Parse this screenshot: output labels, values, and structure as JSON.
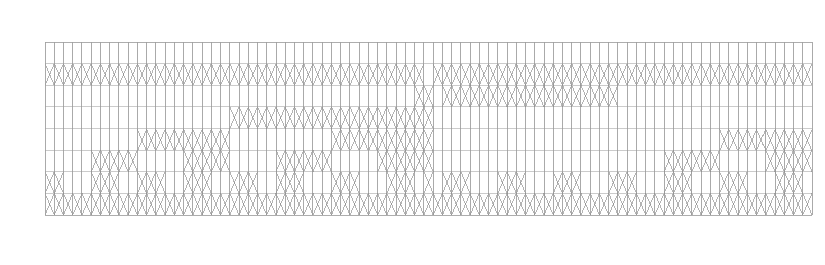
{
  "figure": {
    "kind": "trellis-network",
    "background_color": "#ffffff",
    "line_color": "#9a9a9a",
    "grid_color": "#a8a8a8",
    "cross_color": "#808080"
  },
  "chart_data": {
    "type": "diagram",
    "title": "",
    "xlabel": "",
    "ylabel": "",
    "geometry": {
      "plot_left": 45,
      "plot_top": 42,
      "plot_right": 812,
      "plot_bottom": 215,
      "rows": 8,
      "columns": 83,
      "cell_width": 9.24,
      "row_height": 21.6,
      "block_split_column": 42,
      "blocks": 2,
      "grid": true,
      "legend": "none",
      "axis_ticks": false
    },
    "legend_entries": [],
    "annotations": [],
    "series": [
      {
        "name": "row-0",
        "crossings": [
          0,
          0,
          0,
          0,
          0,
          0,
          0,
          0,
          0,
          0,
          0,
          0,
          0,
          0,
          0,
          0,
          0,
          0,
          0,
          0,
          0,
          0,
          0,
          0,
          0,
          0,
          0,
          0,
          0,
          0,
          0,
          0,
          0,
          0,
          0,
          0,
          0,
          0,
          0,
          0,
          0,
          0,
          0,
          0,
          0,
          0,
          0,
          0,
          0,
          0,
          0,
          0,
          0,
          0,
          0,
          0,
          0,
          0,
          0,
          0,
          0,
          0,
          0,
          0,
          0,
          0,
          0,
          0,
          0,
          0,
          0,
          0,
          0,
          0,
          0,
          0,
          0,
          0,
          0,
          0,
          0,
          0,
          0
        ]
      },
      {
        "name": "row-1",
        "crossings": [
          1,
          1,
          1,
          1,
          1,
          1,
          1,
          1,
          1,
          1,
          1,
          1,
          1,
          1,
          1,
          1,
          1,
          1,
          1,
          1,
          1,
          1,
          1,
          1,
          1,
          1,
          1,
          1,
          1,
          1,
          1,
          1,
          1,
          1,
          1,
          1,
          1,
          1,
          1,
          1,
          1,
          0,
          1,
          1,
          1,
          1,
          1,
          1,
          1,
          1,
          1,
          1,
          1,
          1,
          1,
          1,
          1,
          1,
          1,
          1,
          1,
          1,
          1,
          1,
          1,
          1,
          1,
          1,
          1,
          1,
          1,
          1,
          1,
          1,
          1,
          1,
          1,
          1,
          1,
          1,
          1,
          1,
          1
        ]
      },
      {
        "name": "row-2",
        "crossings": [
          0,
          0,
          0,
          0,
          0,
          0,
          0,
          0,
          0,
          0,
          0,
          0,
          0,
          0,
          0,
          0,
          0,
          0,
          0,
          0,
          0,
          0,
          0,
          0,
          0,
          0,
          0,
          0,
          0,
          0,
          0,
          0,
          0,
          0,
          0,
          0,
          0,
          0,
          0,
          0,
          1,
          1,
          1,
          1,
          1,
          1,
          1,
          1,
          1,
          1,
          1,
          1,
          1,
          1,
          1,
          1,
          1,
          1,
          1,
          1,
          1,
          1,
          0,
          0,
          0,
          0,
          0,
          0,
          0,
          0,
          0,
          0,
          0,
          0,
          0,
          0,
          0,
          0,
          0,
          0,
          0,
          0,
          0
        ]
      },
      {
        "name": "row-3",
        "crossings": [
          0,
          0,
          0,
          0,
          0,
          0,
          0,
          0,
          0,
          0,
          0,
          0,
          0,
          0,
          0,
          0,
          0,
          0,
          0,
          0,
          1,
          1,
          1,
          1,
          1,
          1,
          1,
          1,
          1,
          1,
          1,
          1,
          1,
          1,
          1,
          1,
          1,
          1,
          1,
          1,
          1,
          1,
          0,
          0,
          0,
          0,
          0,
          0,
          0,
          0,
          0,
          0,
          0,
          0,
          0,
          0,
          0,
          0,
          0,
          0,
          0,
          0,
          0,
          0,
          0,
          0,
          0,
          0,
          0,
          0,
          0,
          0,
          0,
          0,
          0,
          0,
          0,
          0,
          0,
          0,
          0,
          0,
          0
        ]
      },
      {
        "name": "row-4",
        "crossings": [
          0,
          0,
          0,
          0,
          0,
          0,
          0,
          0,
          0,
          0,
          1,
          1,
          1,
          1,
          1,
          1,
          1,
          1,
          1,
          1,
          0,
          0,
          0,
          0,
          0,
          0,
          0,
          0,
          0,
          0,
          0,
          1,
          1,
          1,
          1,
          1,
          1,
          1,
          1,
          1,
          1,
          1,
          0,
          0,
          0,
          0,
          0,
          0,
          0,
          0,
          0,
          0,
          0,
          0,
          0,
          0,
          0,
          0,
          0,
          0,
          0,
          0,
          0,
          0,
          0,
          0,
          0,
          0,
          0,
          0,
          0,
          0,
          0,
          1,
          1,
          1,
          1,
          1,
          1,
          1,
          1,
          1,
          1
        ]
      },
      {
        "name": "row-5",
        "crossings": [
          0,
          0,
          0,
          0,
          0,
          1,
          1,
          1,
          1,
          1,
          0,
          0,
          0,
          0,
          0,
          1,
          1,
          1,
          1,
          1,
          0,
          0,
          0,
          0,
          0,
          1,
          1,
          1,
          1,
          1,
          1,
          0,
          0,
          0,
          0,
          0,
          1,
          1,
          1,
          1,
          1,
          1,
          0,
          0,
          0,
          0,
          0,
          0,
          0,
          0,
          0,
          0,
          0,
          0,
          0,
          0,
          0,
          0,
          0,
          0,
          0,
          0,
          0,
          0,
          0,
          0,
          0,
          1,
          1,
          1,
          1,
          1,
          1,
          0,
          0,
          0,
          0,
          0,
          1,
          1,
          1,
          1,
          1
        ]
      },
      {
        "name": "row-6",
        "crossings": [
          1,
          1,
          0,
          0,
          0,
          1,
          1,
          1,
          0,
          0,
          1,
          1,
          1,
          0,
          0,
          1,
          1,
          1,
          0,
          0,
          1,
          1,
          1,
          0,
          0,
          1,
          1,
          1,
          0,
          0,
          0,
          1,
          1,
          1,
          0,
          0,
          0,
          1,
          1,
          1,
          0,
          1,
          0,
          1,
          1,
          1,
          0,
          0,
          0,
          1,
          1,
          1,
          0,
          0,
          0,
          1,
          1,
          1,
          0,
          0,
          0,
          1,
          1,
          1,
          0,
          0,
          0,
          1,
          1,
          1,
          0,
          0,
          0,
          1,
          1,
          1,
          0,
          0,
          0,
          1,
          1,
          1,
          0
        ]
      },
      {
        "name": "row-7",
        "crossings": [
          1,
          1,
          1,
          1,
          1,
          1,
          1,
          1,
          1,
          1,
          1,
          1,
          1,
          1,
          1,
          1,
          1,
          1,
          1,
          1,
          1,
          1,
          1,
          1,
          1,
          1,
          1,
          1,
          1,
          1,
          1,
          1,
          1,
          1,
          1,
          1,
          1,
          1,
          1,
          1,
          1,
          1,
          1,
          1,
          1,
          1,
          1,
          1,
          1,
          1,
          1,
          1,
          1,
          1,
          1,
          1,
          1,
          1,
          1,
          1,
          1,
          1,
          1,
          1,
          1,
          1,
          1,
          1,
          1,
          1,
          1,
          1,
          1,
          1,
          1,
          1,
          1,
          1,
          1,
          1,
          1,
          1,
          1
        ]
      }
    ]
  }
}
